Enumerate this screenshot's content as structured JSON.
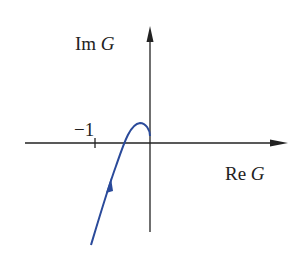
{
  "diagram": {
    "type": "nyquist-plot",
    "y_axis_label_prefix": "Im",
    "y_axis_label_var": "G",
    "x_axis_label_prefix": "Re",
    "x_axis_label_var": "G",
    "tick_label": "−1",
    "curve_color": "#2a4a9a",
    "axis_color": "#222222"
  }
}
